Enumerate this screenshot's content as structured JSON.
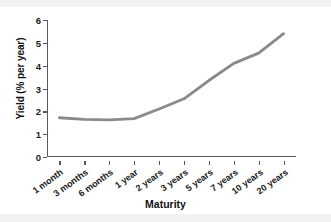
{
  "chart_data": {
    "type": "line",
    "title": "",
    "xlabel": "Maturity",
    "ylabel": "Yield (% per year)",
    "categories": [
      "1 month",
      "3 months",
      "6 months",
      "1 year",
      "2 years",
      "3 years",
      "5 years",
      "7 years",
      "10 years",
      "20 years"
    ],
    "values": [
      1.72,
      1.65,
      1.63,
      1.68,
      2.1,
      2.55,
      3.35,
      4.1,
      4.55,
      5.4
    ],
    "series": [
      {
        "name": "Yield curve",
        "values": [
          1.72,
          1.65,
          1.63,
          1.68,
          2.1,
          2.55,
          3.35,
          4.1,
          4.55,
          5.4
        ]
      }
    ],
    "ylim": [
      0,
      6
    ],
    "yticks": [
      "0",
      "1",
      "2",
      "3",
      "4",
      "5",
      "6"
    ],
    "xtick_labels": [
      "1 month",
      "3 months",
      "6 months",
      "1 year",
      "2 years",
      "3 years",
      "5 years",
      "7 years",
      "10 years",
      "20 years"
    ],
    "grid": false,
    "legend": "none",
    "line_color": "#8a8a8a",
    "axis_color": "#5a5a5a",
    "text_color": "#111111",
    "background": "#ffffff",
    "last_point_drawn_category": "10 years",
    "note": "Line is drawn from 1 month through just past 10 years; 20 years tick label shown without data point."
  }
}
